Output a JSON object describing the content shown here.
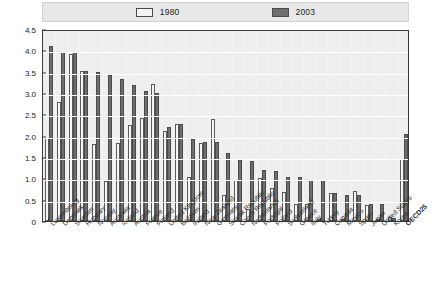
{
  "legend": {
    "position": "top-center",
    "entries": [
      {
        "label": "1980",
        "swatch": "1980-swatch",
        "color": "#f4f4f4"
      },
      {
        "label": "2003",
        "swatch": "2003-swatch",
        "color": "#6f6f6f"
      }
    ]
  },
  "axis": {
    "y_ticks": [
      "4.5",
      "4.0",
      "3.5",
      "3.0",
      "2.5",
      "2.0",
      "1.5",
      "1.0",
      "0.5",
      "0"
    ]
  },
  "chart_data": {
    "type": "bar",
    "title": "",
    "subtitle": "",
    "xlabel": "",
    "ylabel": "",
    "ylim": [
      0,
      4.5
    ],
    "ytick_values": [
      0,
      0.5,
      1.0,
      1.5,
      2.0,
      2.5,
      3.0,
      3.5,
      4.0,
      4.5
    ],
    "grid": true,
    "legend_position": "top-center",
    "orientation": "vertical",
    "bar_mode": "grouped",
    "categories": [
      "Luxembourg",
      "Denmark",
      "Sweden",
      "Hungary",
      "Norway",
      "Australia",
      "Iceland",
      "Austria",
      "France",
      "Finland",
      "United Kingdom",
      "Belgium",
      "Ireland",
      "New Zealand",
      "Germany",
      "Slovak Republic",
      "Czech Republic",
      "Netherlands",
      "Portugal",
      "Poland",
      "Switzerland",
      "Greece",
      "Italy",
      "Turkey",
      "Canada",
      "Mexico",
      "Spain",
      "Japan",
      "United States",
      "Korea",
      "OECD25"
    ],
    "series": [
      {
        "name": "1980",
        "color": "#f6f6f6",
        "values": [
          1.95,
          2.78,
          3.92,
          3.52,
          1.8,
          0.94,
          1.82,
          2.26,
          2.42,
          3.22,
          2.12,
          2.28,
          1.04,
          1.82,
          2.4,
          0.62,
          0.97,
          0.27,
          1.0,
          0.78,
          0.68,
          0.39,
          0.39,
          0.0,
          0.66,
          0.0,
          0.7,
          0.38,
          0.0,
          0.1,
          1.45
        ]
      },
      {
        "name": "2003",
        "color": "#6e6e6e",
        "values": [
          4.1,
          3.95,
          3.95,
          3.52,
          3.5,
          3.43,
          3.33,
          3.18,
          3.05,
          3.0,
          2.21,
          2.28,
          1.93,
          1.85,
          1.85,
          1.6,
          1.44,
          1.4,
          1.2,
          1.17,
          1.02,
          1.02,
          0.97,
          0.97,
          0.65,
          0.6,
          0.6,
          0.4,
          0.4,
          0.08,
          2.05
        ]
      }
    ]
  }
}
